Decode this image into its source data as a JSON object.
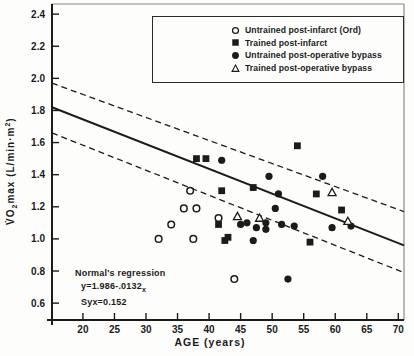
{
  "chart_data": {
    "type": "scatter",
    "title": "",
    "xlabel": "AGE  (years)",
    "ylabel_parts": {
      "pre": "V̇O",
      "sub": "2",
      "mid": "max  (L/min·m",
      "sup": "2",
      "post": ")"
    },
    "xlim": [
      15.1,
      70.9
    ],
    "ylim": [
      0.495,
      2.463
    ],
    "xticks": [
      20,
      25,
      30,
      35,
      40,
      45,
      50,
      55,
      60,
      65,
      70
    ],
    "yticks": [
      0.6,
      0.8,
      1.0,
      1.2,
      1.4,
      1.6,
      1.8,
      2.0,
      2.2,
      2.4
    ],
    "grid": false,
    "legend_position": "top-right",
    "series": [
      {
        "name": "Untrained post-infarct (Ord)",
        "marker": "circle-open",
        "points": [
          [
            37,
            1.3
          ],
          [
            36,
            1.19
          ],
          [
            38,
            1.19
          ],
          [
            41.5,
            1.13
          ],
          [
            34,
            1.09
          ],
          [
            32,
            1.0
          ],
          [
            37.5,
            1.0
          ],
          [
            44,
            0.75
          ]
        ]
      },
      {
        "name": "Trained post-infarct",
        "marker": "square-filled",
        "points": [
          [
            38,
            1.5
          ],
          [
            39.5,
            1.5
          ],
          [
            54,
            1.58
          ],
          [
            47,
            1.32
          ],
          [
            42,
            1.3
          ],
          [
            57,
            1.28
          ],
          [
            41.5,
            1.09
          ],
          [
            42.5,
            0.99
          ],
          [
            43,
            1.01
          ],
          [
            56,
            0.98
          ],
          [
            61,
            1.18
          ]
        ]
      },
      {
        "name": "Untrained post-operative bypass",
        "marker": "circle-filled",
        "points": [
          [
            42,
            1.49
          ],
          [
            49.5,
            1.39
          ],
          [
            58,
            1.39
          ],
          [
            51,
            1.28
          ],
          [
            50.5,
            1.19
          ],
          [
            45,
            1.09
          ],
          [
            46,
            1.1
          ],
          [
            47.5,
            1.07
          ],
          [
            49,
            1.1
          ],
          [
            49,
            1.06
          ],
          [
            51.5,
            1.09
          ],
          [
            53.5,
            1.08
          ],
          [
            59.5,
            1.07
          ],
          [
            62.5,
            1.08
          ],
          [
            47,
            0.99
          ],
          [
            52.5,
            0.75
          ]
        ]
      },
      {
        "name": "Trained post-operative bypass",
        "marker": "triangle-open",
        "points": [
          [
            44.5,
            1.14
          ],
          [
            48,
            1.13
          ],
          [
            59.5,
            1.29
          ],
          [
            62,
            1.11
          ]
        ]
      }
    ],
    "regression_lines": {
      "solid": {
        "x": [
          15.1,
          70.9
        ],
        "y": [
          1.82,
          0.96
        ]
      },
      "upper_dashed": {
        "x": [
          15.1,
          70.9
        ],
        "y": [
          1.97,
          1.17
        ]
      },
      "lower_dashed": {
        "x": [
          15.1,
          70.9
        ],
        "y": [
          1.66,
          0.79
        ]
      }
    }
  },
  "annotation": {
    "title": "Normal's regression",
    "eq_main": "y=1.986-.0132",
    "eq_sub": "x",
    "syx": "Syx=0.152"
  },
  "colors": {
    "ink": "#1b1b1b",
    "border_light": "#8a8a8a",
    "background": "#fdfdfc"
  }
}
